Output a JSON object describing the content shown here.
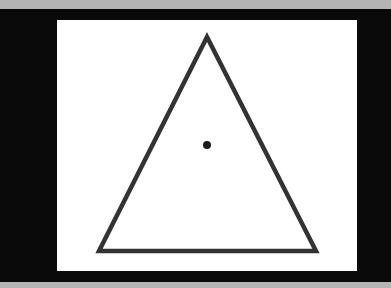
{
  "figure": {
    "shape": "triangle",
    "stroke_color": "#333333",
    "fill_color": "#ffffff",
    "stroke_width": 4.5,
    "vertices": [
      [
        207,
        37
      ],
      [
        99,
        251
      ],
      [
        316,
        251
      ]
    ],
    "center_dot": {
      "cx": 207,
      "cy": 145,
      "r": 4,
      "color": "#1a1a1a"
    }
  },
  "colors": {
    "outer_band": "#b4b4b4",
    "frame": "#0a0a0a",
    "panel": "#ffffff"
  }
}
